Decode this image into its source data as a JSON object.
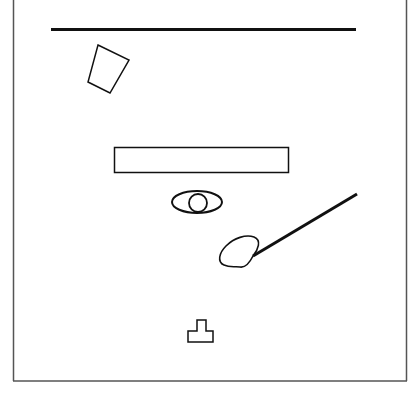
{
  "canvas": {
    "width": 413,
    "height": 396,
    "background": "#ffffff"
  },
  "colors": {
    "stroke": "#111111",
    "frame": "#555555"
  },
  "frame": {
    "x1": 13,
    "x2": 406,
    "y_bottom": 381
  },
  "shapes": [
    {
      "id": "top-line",
      "type": "line",
      "x1": 51,
      "y1": 29,
      "x2": 356,
      "y2": 29,
      "stroke_width": 3
    },
    {
      "id": "trapezoid",
      "type": "polygon",
      "points": "98,45 129,60 110,93 88,82"
    },
    {
      "id": "rectangle",
      "type": "rect",
      "x": 114,
      "y": 147,
      "width": 175,
      "height": 25
    },
    {
      "id": "eye-ellipse",
      "type": "ellipse",
      "cx": 197,
      "cy": 202,
      "rx": 25,
      "ry": 11
    },
    {
      "id": "eye-circle",
      "type": "circle",
      "cx": 198,
      "cy": 203,
      "r": 9
    },
    {
      "id": "diagonal-line",
      "type": "line",
      "x1": 357,
      "y1": 194,
      "x2": 253,
      "y2": 256,
      "stroke_width": 3
    },
    {
      "id": "blob",
      "type": "path"
    },
    {
      "id": "t-shape",
      "type": "polygon",
      "points": "188,331 197,331 197,320 206,320 206,331 213,331 213,342 188,342"
    }
  ]
}
